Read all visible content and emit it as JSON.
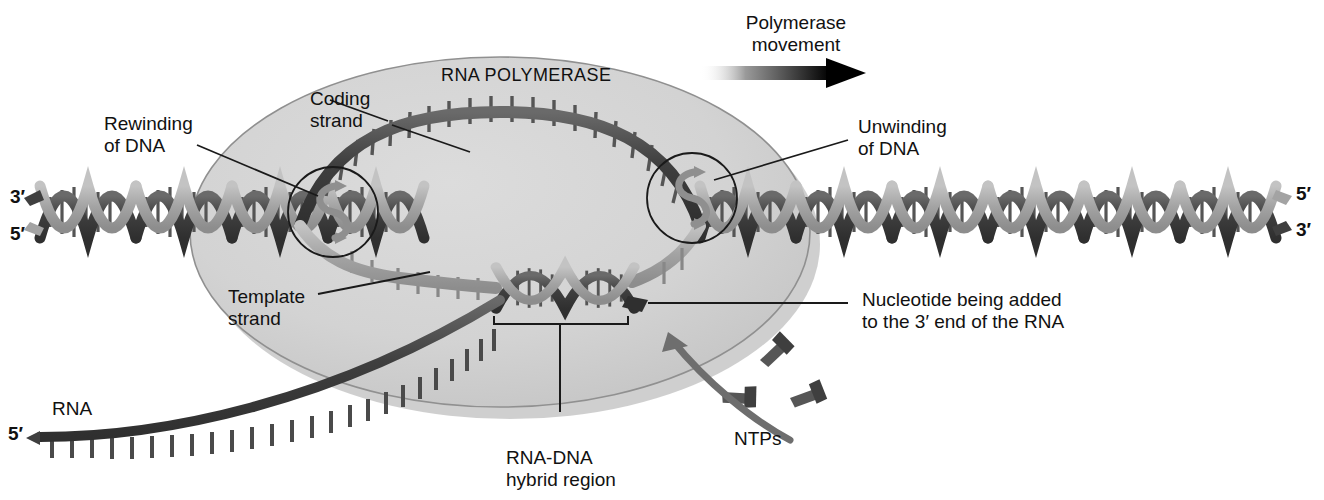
{
  "figure": {
    "title_inside": "RNA POLYMERASE",
    "topic": "transcription-elongation-diagram"
  },
  "labels": {
    "polymerase_movement": "Polymerase\nmovement",
    "rna_polymerase": "RNA POLYMERASE",
    "coding_strand": "Coding\nstrand",
    "rewinding": "Rewinding\nof DNA",
    "unwinding": "Unwinding\nof DNA",
    "template_strand": "Template\nstrand",
    "nucleotide_added": "Nucleotide being added\nto the 3′ end of the RNA",
    "hybrid_region": "RNA-DNA\nhybrid region",
    "ntps": "NTPs",
    "rna": "RNA"
  },
  "prime_ends": {
    "left_top": "3′",
    "left_bottom": "5′",
    "right_top": "5′",
    "right_bottom": "3′",
    "rna_five": "5′"
  },
  "colors": {
    "background": "#ffffff",
    "polymerase_fill": "#d2d2d2",
    "polymerase_shadow": "#bdbdbd",
    "polymerase_outline": "#8e8e8e",
    "strand_dark": "#4a4a4a",
    "strand_light": "#a6a6a6",
    "rung": "#5e5e5e",
    "text": "#111111",
    "leader_line": "#111111",
    "ntp_glyph": "#5a5a5a",
    "curved_arrow": "#6e6e6e",
    "movement_arrow": "#000000"
  },
  "elements": {
    "unwinding_circles": 2,
    "ntp_count": 3,
    "movement_arrow_direction": "right"
  }
}
